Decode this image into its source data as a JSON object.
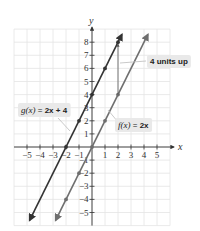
{
  "chart_data": {
    "type": "line",
    "title": "",
    "xlabel": "x",
    "ylabel": "y",
    "xlim": [
      -6,
      6
    ],
    "ylim": [
      -6,
      9
    ],
    "xticks": [
      -5,
      -4,
      -3,
      -2,
      -1,
      1,
      2,
      3,
      4,
      5
    ],
    "yticks": [
      -5,
      -4,
      -3,
      -2,
      -1,
      1,
      2,
      3,
      4,
      5,
      6,
      7,
      8
    ],
    "grid": true,
    "series": [
      {
        "name": "g(x) = 2x + 4",
        "slope": 2,
        "intercept": 4,
        "color": "#333333",
        "points": [
          [
            -2,
            0
          ],
          [
            -1,
            2
          ],
          [
            0,
            4
          ],
          [
            1,
            6
          ],
          [
            2,
            8
          ]
        ],
        "x_range": [
          -4.8,
          2.3
        ]
      },
      {
        "name": "f(x) = 2x",
        "slope": 2,
        "intercept": 0,
        "color": "#6e6e6e",
        "points": [
          [
            -2,
            -4
          ],
          [
            -1,
            -2
          ],
          [
            0,
            0
          ],
          [
            1,
            2
          ],
          [
            2,
            4
          ]
        ],
        "x_range": [
          -2.8,
          4.3
        ]
      }
    ],
    "annotations": [
      {
        "type": "vertical-arrow",
        "from": [
          2,
          4
        ],
        "to": [
          2,
          8
        ],
        "label": "4 units up"
      }
    ],
    "labels": {
      "g": {
        "func": "g(x)",
        "eq": " = ",
        "expr": "2x + 4"
      },
      "f": {
        "func": "f(x)",
        "eq": " = ",
        "expr": "2x"
      },
      "shift": "4 units up"
    }
  }
}
